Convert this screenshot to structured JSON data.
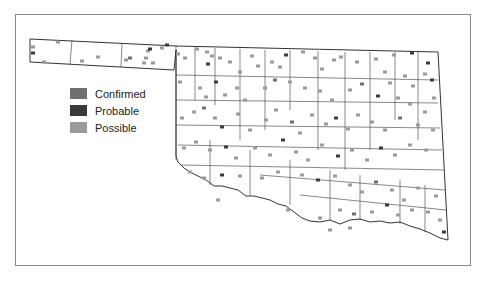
{
  "legend": {
    "items": [
      {
        "label": "Confirmed",
        "color": "#707070"
      },
      {
        "label": "Probable",
        "color": "#3a3a3a"
      },
      {
        "label": "Possible",
        "color": "#9a9a9a"
      }
    ]
  },
  "map": {
    "outline_color": "#333333",
    "county_line_color": "#555555",
    "state_outline": "M30,39 L176,46 L438,52 L448,240 L440,238 L430,233 L420,229 L410,226 L400,222 L390,223 L380,221 L370,222 L360,219 L350,220 L340,224 L330,220 L320,222 L310,221 L302,218 L294,212 L286,206 L278,204 L270,200 L262,198 L254,196 L246,196 L238,190 L230,188 L222,186 L214,186 L206,180 L198,176 L190,172 L184,168 L178,162 L176,156 L176,50 L174,70 L30,62 Z",
    "county_lines": [
      "M72,40 L70,64",
      "M122,43 L121,67",
      "M176,46 L176,160",
      "M195,47 L195,100",
      "M215,48 L215,105",
      "M240,49 L240,140",
      "M265,50 L265,130",
      "M290,50 L290,110",
      "M318,51 L318,150",
      "M345,52 L345,170",
      "M370,52 L370,150",
      "M395,52 L395,120",
      "M418,52 L418,140",
      "M176,75 L438,80",
      "M176,100 L438,103",
      "M176,125 L440,128",
      "M178,145 L442,150",
      "M182,165 L444,170",
      "M260,175 L445,190",
      "M300,195 L446,210",
      "M210,140 L210,185",
      "M250,150 L250,195",
      "M290,160 L290,205",
      "M330,170 L330,220",
      "M360,175 L360,220",
      "M400,180 L400,224",
      "M425,185 L425,232"
    ],
    "markers": [
      {
        "x": 33,
        "y": 47,
        "type": "possible"
      },
      {
        "x": 58,
        "y": 42,
        "type": "possible"
      },
      {
        "x": 33,
        "y": 53,
        "type": "probable"
      },
      {
        "x": 44,
        "y": 62,
        "type": "possible"
      },
      {
        "x": 82,
        "y": 61,
        "type": "possible"
      },
      {
        "x": 98,
        "y": 57,
        "type": "possible"
      },
      {
        "x": 126,
        "y": 60,
        "type": "possible"
      },
      {
        "x": 130,
        "y": 58,
        "type": "confirmed"
      },
      {
        "x": 146,
        "y": 58,
        "type": "possible"
      },
      {
        "x": 148,
        "y": 51,
        "type": "possible"
      },
      {
        "x": 150,
        "y": 49,
        "type": "probable"
      },
      {
        "x": 162,
        "y": 48,
        "type": "possible"
      },
      {
        "x": 144,
        "y": 63,
        "type": "possible"
      },
      {
        "x": 153,
        "y": 63,
        "type": "possible"
      },
      {
        "x": 167,
        "y": 45,
        "type": "probable"
      },
      {
        "x": 178,
        "y": 54,
        "type": "possible"
      },
      {
        "x": 185,
        "y": 58,
        "type": "possible"
      },
      {
        "x": 197,
        "y": 49,
        "type": "possible"
      },
      {
        "x": 207,
        "y": 52,
        "type": "possible"
      },
      {
        "x": 212,
        "y": 56,
        "type": "possible"
      },
      {
        "x": 208,
        "y": 64,
        "type": "probable"
      },
      {
        "x": 220,
        "y": 58,
        "type": "possible"
      },
      {
        "x": 230,
        "y": 62,
        "type": "possible"
      },
      {
        "x": 240,
        "y": 72,
        "type": "possible"
      },
      {
        "x": 252,
        "y": 56,
        "type": "possible"
      },
      {
        "x": 258,
        "y": 66,
        "type": "possible"
      },
      {
        "x": 272,
        "y": 62,
        "type": "possible"
      },
      {
        "x": 280,
        "y": 67,
        "type": "possible"
      },
      {
        "x": 286,
        "y": 55,
        "type": "probable"
      },
      {
        "x": 303,
        "y": 52,
        "type": "possible"
      },
      {
        "x": 315,
        "y": 58,
        "type": "possible"
      },
      {
        "x": 322,
        "y": 69,
        "type": "possible"
      },
      {
        "x": 334,
        "y": 60,
        "type": "possible"
      },
      {
        "x": 341,
        "y": 57,
        "type": "possible"
      },
      {
        "x": 357,
        "y": 62,
        "type": "possible"
      },
      {
        "x": 376,
        "y": 59,
        "type": "possible"
      },
      {
        "x": 394,
        "y": 55,
        "type": "possible"
      },
      {
        "x": 412,
        "y": 53,
        "type": "probable"
      },
      {
        "x": 428,
        "y": 63,
        "type": "probable"
      },
      {
        "x": 385,
        "y": 72,
        "type": "possible"
      },
      {
        "x": 390,
        "y": 83,
        "type": "possible"
      },
      {
        "x": 405,
        "y": 76,
        "type": "possible"
      },
      {
        "x": 413,
        "y": 86,
        "type": "possible"
      },
      {
        "x": 425,
        "y": 74,
        "type": "possible"
      },
      {
        "x": 432,
        "y": 80,
        "type": "probable"
      },
      {
        "x": 180,
        "y": 82,
        "type": "possible"
      },
      {
        "x": 200,
        "y": 88,
        "type": "possible"
      },
      {
        "x": 206,
        "y": 97,
        "type": "possible"
      },
      {
        "x": 216,
        "y": 82,
        "type": "probable"
      },
      {
        "x": 225,
        "y": 95,
        "type": "possible"
      },
      {
        "x": 237,
        "y": 88,
        "type": "possible"
      },
      {
        "x": 245,
        "y": 100,
        "type": "possible"
      },
      {
        "x": 265,
        "y": 88,
        "type": "possible"
      },
      {
        "x": 275,
        "y": 80,
        "type": "confirmed"
      },
      {
        "x": 290,
        "y": 82,
        "type": "possible"
      },
      {
        "x": 305,
        "y": 88,
        "type": "possible"
      },
      {
        "x": 320,
        "y": 91,
        "type": "possible"
      },
      {
        "x": 332,
        "y": 100,
        "type": "possible"
      },
      {
        "x": 350,
        "y": 90,
        "type": "possible"
      },
      {
        "x": 362,
        "y": 84,
        "type": "confirmed"
      },
      {
        "x": 378,
        "y": 96,
        "type": "probable"
      },
      {
        "x": 398,
        "y": 98,
        "type": "possible"
      },
      {
        "x": 410,
        "y": 104,
        "type": "possible"
      },
      {
        "x": 425,
        "y": 112,
        "type": "possible"
      },
      {
        "x": 434,
        "y": 98,
        "type": "possible"
      },
      {
        "x": 182,
        "y": 118,
        "type": "possible"
      },
      {
        "x": 194,
        "y": 112,
        "type": "possible"
      },
      {
        "x": 204,
        "y": 108,
        "type": "confirmed"
      },
      {
        "x": 215,
        "y": 118,
        "type": "possible"
      },
      {
        "x": 222,
        "y": 127,
        "type": "probable"
      },
      {
        "x": 238,
        "y": 114,
        "type": "possible"
      },
      {
        "x": 250,
        "y": 130,
        "type": "possible"
      },
      {
        "x": 266,
        "y": 120,
        "type": "possible"
      },
      {
        "x": 276,
        "y": 110,
        "type": "possible"
      },
      {
        "x": 292,
        "y": 122,
        "type": "confirmed"
      },
      {
        "x": 300,
        "y": 133,
        "type": "possible"
      },
      {
        "x": 312,
        "y": 115,
        "type": "possible"
      },
      {
        "x": 326,
        "y": 124,
        "type": "possible"
      },
      {
        "x": 336,
        "y": 118,
        "type": "probable"
      },
      {
        "x": 348,
        "y": 129,
        "type": "possible"
      },
      {
        "x": 358,
        "y": 115,
        "type": "possible"
      },
      {
        "x": 372,
        "y": 122,
        "type": "possible"
      },
      {
        "x": 385,
        "y": 130,
        "type": "possible"
      },
      {
        "x": 400,
        "y": 118,
        "type": "confirmed"
      },
      {
        "x": 418,
        "y": 125,
        "type": "possible"
      },
      {
        "x": 433,
        "y": 130,
        "type": "possible"
      },
      {
        "x": 184,
        "y": 148,
        "type": "possible"
      },
      {
        "x": 196,
        "y": 142,
        "type": "possible"
      },
      {
        "x": 210,
        "y": 150,
        "type": "possible"
      },
      {
        "x": 226,
        "y": 147,
        "type": "probable"
      },
      {
        "x": 236,
        "y": 158,
        "type": "possible"
      },
      {
        "x": 255,
        "y": 148,
        "type": "possible"
      },
      {
        "x": 270,
        "y": 155,
        "type": "possible"
      },
      {
        "x": 283,
        "y": 140,
        "type": "probable"
      },
      {
        "x": 296,
        "y": 152,
        "type": "possible"
      },
      {
        "x": 308,
        "y": 160,
        "type": "possible"
      },
      {
        "x": 322,
        "y": 145,
        "type": "possible"
      },
      {
        "x": 338,
        "y": 156,
        "type": "probable"
      },
      {
        "x": 352,
        "y": 150,
        "type": "possible"
      },
      {
        "x": 367,
        "y": 160,
        "type": "possible"
      },
      {
        "x": 381,
        "y": 148,
        "type": "probable"
      },
      {
        "x": 395,
        "y": 155,
        "type": "possible"
      },
      {
        "x": 410,
        "y": 145,
        "type": "possible"
      },
      {
        "x": 426,
        "y": 150,
        "type": "possible"
      },
      {
        "x": 190,
        "y": 172,
        "type": "possible"
      },
      {
        "x": 204,
        "y": 178,
        "type": "possible"
      },
      {
        "x": 222,
        "y": 175,
        "type": "probable"
      },
      {
        "x": 240,
        "y": 176,
        "type": "possible"
      },
      {
        "x": 262,
        "y": 178,
        "type": "possible"
      },
      {
        "x": 278,
        "y": 172,
        "type": "possible"
      },
      {
        "x": 302,
        "y": 175,
        "type": "possible"
      },
      {
        "x": 318,
        "y": 180,
        "type": "probable"
      },
      {
        "x": 335,
        "y": 176,
        "type": "possible"
      },
      {
        "x": 350,
        "y": 185,
        "type": "possible"
      },
      {
        "x": 362,
        "y": 192,
        "type": "possible"
      },
      {
        "x": 376,
        "y": 182,
        "type": "confirmed"
      },
      {
        "x": 392,
        "y": 190,
        "type": "possible"
      },
      {
        "x": 404,
        "y": 200,
        "type": "possible"
      },
      {
        "x": 418,
        "y": 188,
        "type": "possible"
      },
      {
        "x": 436,
        "y": 196,
        "type": "possible"
      },
      {
        "x": 218,
        "y": 200,
        "type": "possible"
      },
      {
        "x": 288,
        "y": 210,
        "type": "possible"
      },
      {
        "x": 320,
        "y": 218,
        "type": "possible"
      },
      {
        "x": 340,
        "y": 210,
        "type": "possible"
      },
      {
        "x": 354,
        "y": 214,
        "type": "confirmed"
      },
      {
        "x": 372,
        "y": 212,
        "type": "possible"
      },
      {
        "x": 387,
        "y": 205,
        "type": "probable"
      },
      {
        "x": 398,
        "y": 215,
        "type": "possible"
      },
      {
        "x": 412,
        "y": 210,
        "type": "possible"
      },
      {
        "x": 428,
        "y": 212,
        "type": "possible"
      },
      {
        "x": 440,
        "y": 220,
        "type": "possible"
      },
      {
        "x": 444,
        "y": 232,
        "type": "probable"
      },
      {
        "x": 330,
        "y": 230,
        "type": "possible"
      },
      {
        "x": 350,
        "y": 228,
        "type": "possible"
      }
    ]
  }
}
